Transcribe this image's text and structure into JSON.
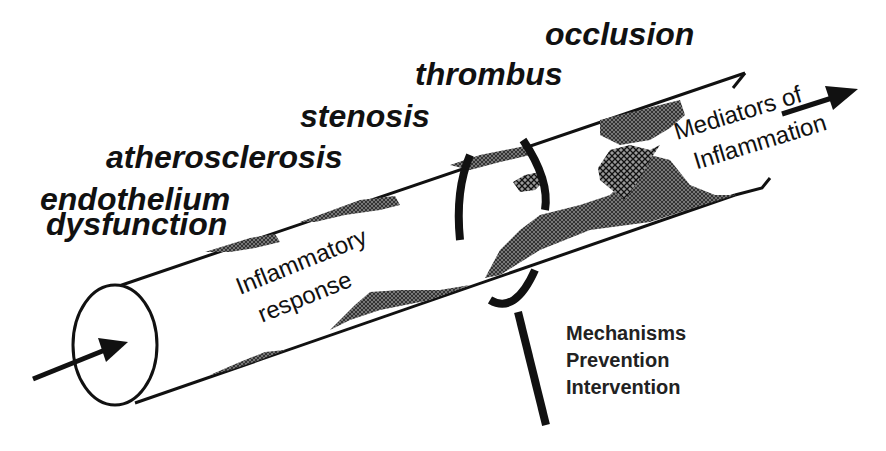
{
  "diagram": {
    "stages": [
      {
        "label": "endothelium",
        "x": 40,
        "y": 210
      },
      {
        "label": "dysfunction",
        "x": 46,
        "y": 235
      },
      {
        "label": "atherosclerosis",
        "x": 106,
        "y": 168
      },
      {
        "label": "stenosis",
        "x": 300,
        "y": 127
      },
      {
        "label": "thrombus",
        "x": 415,
        "y": 85
      },
      {
        "label": "occlusion",
        "x": 545,
        "y": 45
      }
    ],
    "inner_labels": {
      "line1": "Inflammatory",
      "line2": "response"
    },
    "mediators_labels": {
      "line1": "Mediators of",
      "line2": "Inflammation"
    },
    "footer_labels": [
      "Mechanisms",
      "Prevention",
      "Intervention"
    ],
    "colors": {
      "ink": "#111111",
      "plaque_fill": "#555555",
      "background": "#ffffff"
    }
  }
}
